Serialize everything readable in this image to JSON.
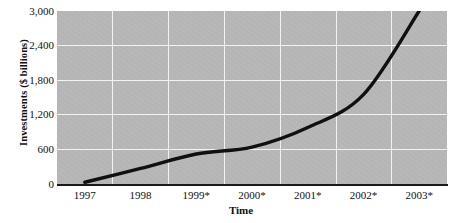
{
  "chart_data": {
    "type": "line",
    "title": "",
    "xlabel": "Time",
    "ylabel": "Investments ($ billions)",
    "categories": [
      "1997",
      "1998",
      "1999*",
      "2000*",
      "2001*",
      "2002*",
      "2003*"
    ],
    "x": [
      1997,
      1998,
      1999,
      2000,
      2001,
      2002,
      2003
    ],
    "values": [
      30,
      270,
      520,
      640,
      980,
      1550,
      3000
    ],
    "series": [
      {
        "name": "Investments",
        "values": [
          30,
          270,
          520,
          640,
          980,
          1550,
          3000
        ],
        "color": "#101010",
        "line_width": 3.4
      }
    ],
    "ylim": [
      0,
      3000
    ],
    "yticks": [
      3000,
      2400,
      1800,
      1200,
      600,
      0
    ],
    "ytick_labels": [
      "3,000",
      "2,400",
      "1,800",
      "1,200",
      "600",
      "0"
    ],
    "grid": true,
    "grid_color": "#f2f2f2",
    "plot_background": "#b9b9b9",
    "legend": "none",
    "note": "* denotes projected values"
  },
  "axes": {
    "y_title": "Investments ($ billions)",
    "x_title": "Time",
    "y_tick_labels": [
      "3,000",
      "2,400",
      "1,800",
      "1,200",
      "600",
      "0"
    ],
    "x_tick_labels": [
      "1997",
      "1998",
      "1999*",
      "2000*",
      "2001*",
      "2002*",
      "2003*"
    ]
  }
}
